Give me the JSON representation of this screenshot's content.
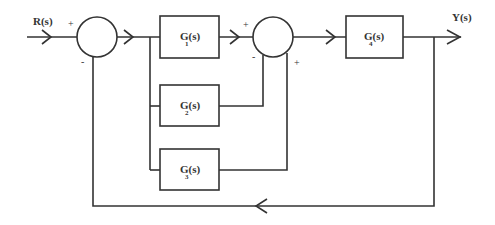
{
  "diagram": {
    "type": "block-diagram",
    "colors": {
      "line": "#333333",
      "background": "#ffffff"
    },
    "signals": {
      "input": "R(s)",
      "output": "Y(s)"
    },
    "summing_junctions": [
      {
        "id": "sum1",
        "signs": {
          "left": "+",
          "bottom": "-"
        }
      },
      {
        "id": "sum2",
        "signs": {
          "left": "+",
          "bottom_left": "-",
          "bottom_right": "+"
        }
      }
    ],
    "blocks": [
      {
        "id": "G1",
        "main": "G(s)",
        "sub": "1"
      },
      {
        "id": "G2",
        "main": "G(s)",
        "sub": "2"
      },
      {
        "id": "G3",
        "main": "G(s)",
        "sub": "3"
      },
      {
        "id": "G4",
        "main": "G(s)",
        "sub": "4"
      }
    ],
    "connections": [
      "R(s) -> sum1(+)",
      "sum1 -> branch -> G1, G2, G3",
      "G1 -> sum2(+)",
      "G2 -> sum2(-)",
      "G3 -> sum2(+)",
      "sum2 -> G4",
      "G4 -> Y(s)",
      "Y(s) -> feedback -> sum1(-)"
    ]
  }
}
